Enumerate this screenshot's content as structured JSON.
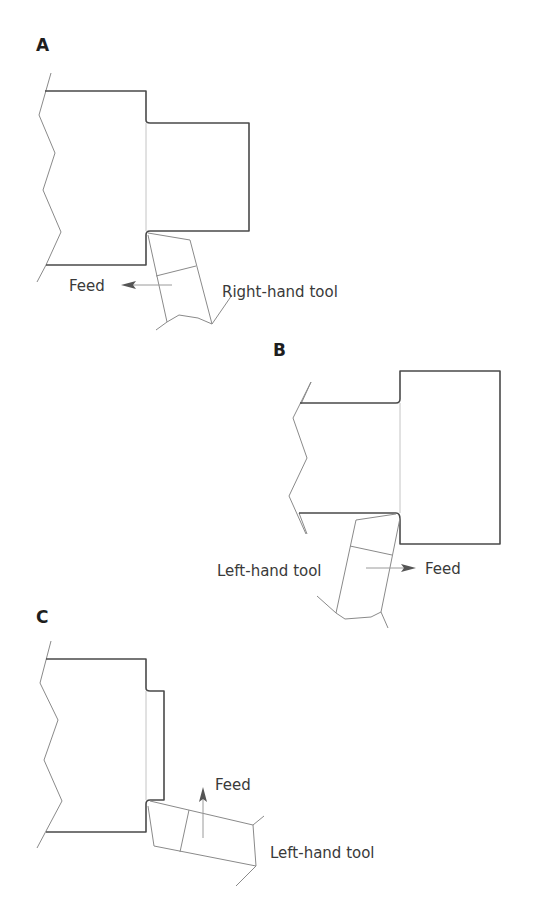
{
  "figure": {
    "panels": [
      {
        "id": "A",
        "letter": "A",
        "feed_label": "Feed",
        "feed_direction": "left",
        "tool_label": "Right-hand tool"
      },
      {
        "id": "B",
        "letter": "B",
        "feed_label": "Feed",
        "feed_direction": "right",
        "tool_label": "Left-hand tool"
      },
      {
        "id": "C",
        "letter": "C",
        "feed_label": "Feed",
        "feed_direction": "up",
        "tool_label": "Left-hand tool"
      }
    ]
  },
  "colors": {
    "outline": "#4a4a4a",
    "thin_line": "#8a8a8a",
    "text": "#3a3a3a",
    "background": "#ffffff"
  }
}
